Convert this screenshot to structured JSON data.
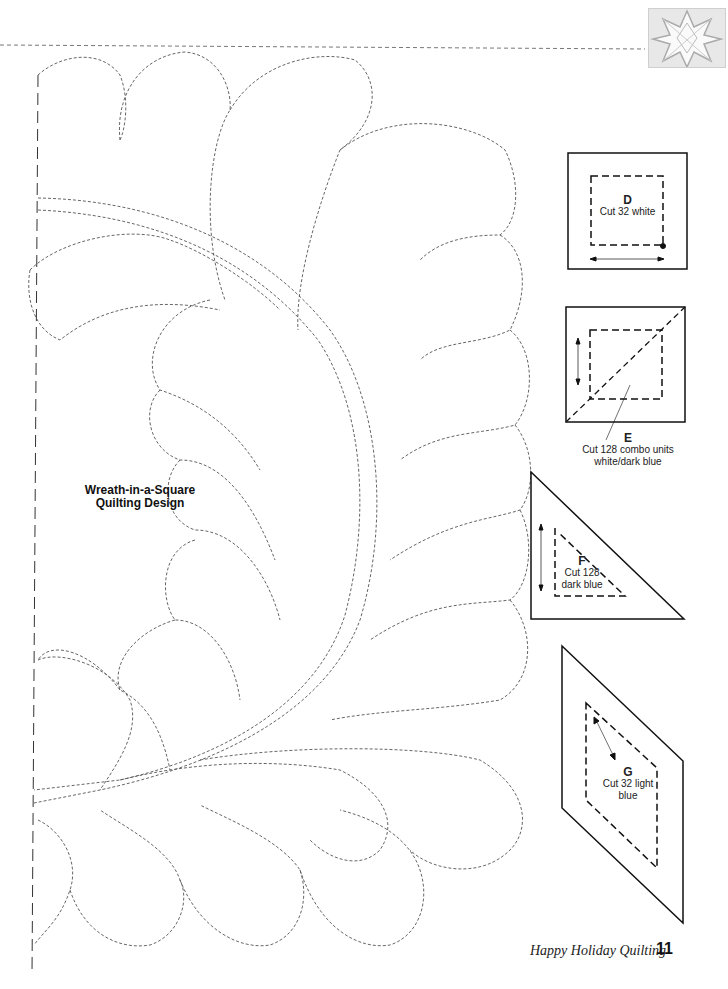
{
  "design": {
    "title_line1": "Wreath-in-a-Square",
    "title_line2": "Quilting Design"
  },
  "templates": [
    {
      "letter": "D",
      "line1": "Cut 32 white",
      "line2": ""
    },
    {
      "letter": "E",
      "line1": "Cut 128 combo units",
      "line2": "white/dark blue"
    },
    {
      "letter": "F",
      "line1": "Cut 128",
      "line2": "dark blue"
    },
    {
      "letter": "G",
      "line1": "Cut 32 light",
      "line2": "blue"
    }
  ],
  "footer": {
    "book_title": "Happy Holiday Quilting",
    "page_number": "11"
  },
  "icons": {
    "corner": "star-quilt-block-icon"
  },
  "colors": {
    "line": "#555555",
    "text": "#111111",
    "background": "#ffffff"
  }
}
